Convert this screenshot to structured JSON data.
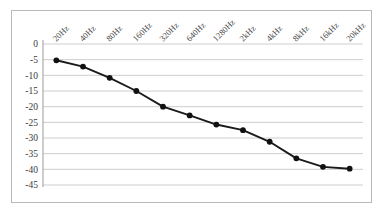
{
  "chart_data": {
    "type": "line",
    "title": "",
    "subtitle": "",
    "xlabel": "",
    "ylabel": "",
    "categories": [
      "20Hz",
      "40Hz",
      "80Hz",
      "160Hz",
      "320Hz",
      "640Hz",
      "1280Hz",
      "2kHz",
      "4kHz",
      "8kHz",
      "16kHz",
      "20kHz"
    ],
    "values": [
      -5.2,
      -7.2,
      -10.8,
      -15.0,
      -20.0,
      -22.8,
      -25.7,
      -27.5,
      -31.2,
      -36.5,
      -39.2,
      -39.8
    ],
    "series": [
      {
        "name": "",
        "values": [
          -5.2,
          -7.2,
          -10.8,
          -15.0,
          -20.0,
          -22.8,
          -25.7,
          -27.5,
          -31.2,
          -36.5,
          -39.2,
          -39.8
        ]
      }
    ],
    "ylim": [
      -45,
      0
    ],
    "ytick_labels": [
      "0",
      "-5",
      "-10",
      "-15",
      "-20",
      "-25",
      "-30",
      "-35",
      "-40",
      "-45"
    ],
    "ytick_values": [
      0,
      -5,
      -10,
      -15,
      -20,
      -25,
      -30,
      -35,
      -40,
      -45
    ],
    "grid": true,
    "grid_axis": "y",
    "legend": false,
    "legend_position": "none",
    "marker": "circle",
    "line_color": "#1a1a1a",
    "marker_color": "#111111",
    "grid_color": "#c8c8c8",
    "xtick_rotation": 45
  },
  "caption": {
    "text": ""
  }
}
